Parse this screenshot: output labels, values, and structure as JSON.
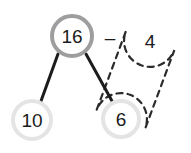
{
  "figure": {
    "type": "number-bond-diagram",
    "background_color": "#ffffff",
    "width": 191,
    "height": 153
  },
  "nodes": {
    "whole": {
      "label": "16",
      "cx": 72,
      "cy": 36,
      "r": 20,
      "ring_color": "#9e9e9e",
      "ring_width": 4,
      "fill": "#ffffff",
      "text_color": "#1c1c1c"
    },
    "part_left": {
      "label": "10",
      "cx": 32,
      "cy": 120,
      "r": 19,
      "ring_color": "#e4e4e4",
      "ring_width": 4,
      "fill": "#ffffff",
      "text_color": "#1c1c1c"
    },
    "part_right": {
      "label": "6",
      "cx": 121,
      "cy": 119,
      "r": 18,
      "ring_color": "#e4e4e4",
      "ring_width": 4,
      "fill": "#ffffff",
      "text_color": "#1c1c1c"
    }
  },
  "operator": {
    "label": "–",
    "x": 110,
    "y": 37,
    "color": "#1c1c1c"
  },
  "subtrahend": {
    "label": "4",
    "x": 150,
    "y": 41,
    "color": "#1c1c1c"
  },
  "connectors": [
    {
      "name": "branch-to-10",
      "x1": 58,
      "y1": 54,
      "x2": 41,
      "y2": 101,
      "color": "#1c1c1c",
      "width": 3
    },
    {
      "name": "branch-to-6",
      "x1": 86,
      "y1": 54,
      "x2": 112,
      "y2": 101,
      "color": "#1c1c1c",
      "width": 3
    }
  ],
  "loop": {
    "name": "dashed-grouping-loop",
    "shape": "stadium",
    "end_a": {
      "cx": 150,
      "cy": 41,
      "r": 26
    },
    "end_b": {
      "cx": 121,
      "cy": 119,
      "r": 26
    },
    "stroke_color": "#2b2b2b",
    "stroke_width": 2.2,
    "dash_pattern": "6 5"
  },
  "chart_data": {
    "type": "diagram",
    "title": "",
    "whole": 16,
    "parts": [
      10,
      6
    ],
    "expression": "16 – 4",
    "grouped": [
      6,
      4
    ],
    "labels": [
      "16",
      "10",
      "6",
      "4",
      "–"
    ]
  }
}
